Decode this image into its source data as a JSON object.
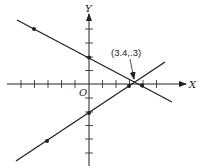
{
  "diagram": {
    "x_axis_label": "X",
    "y_axis_label": "Y",
    "origin_label": "O",
    "intersection_label": "(3.4,.3)",
    "colors": {
      "ink": "#222222",
      "background": "#ffffff"
    }
  },
  "geometry": {
    "origin_px": [
      89,
      84
    ],
    "tick_spacing_px": 13.5,
    "lines": [
      {
        "name": "decreasing-line",
        "from": [
          17,
          20
        ],
        "to": [
          172,
          102
        ],
        "points": [
          [
            34,
            29
          ],
          [
            89,
            57
          ],
          [
            142,
            85
          ]
        ]
      },
      {
        "name": "increasing-line",
        "from": [
          16,
          161
        ],
        "to": [
          165,
          62
        ],
        "points": [
          [
            47,
            141
          ],
          [
            89,
            113
          ],
          [
            129,
            86
          ]
        ]
      }
    ],
    "intersection_px": [
      134,
      81
    ]
  }
}
